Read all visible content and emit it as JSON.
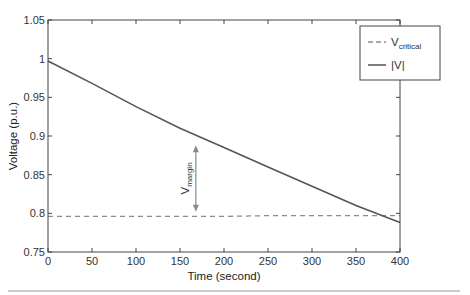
{
  "chart_data": {
    "type": "line",
    "title": "",
    "xlabel": "Time (second)",
    "ylabel": "Voltage (p.u.)",
    "xlim": [
      0,
      400
    ],
    "ylim": [
      0.75,
      1.05
    ],
    "grid": false,
    "legend_position": "upper right",
    "x_ticks": [
      "0",
      "50",
      "100",
      "150",
      "200",
      "250",
      "300",
      "350",
      "400"
    ],
    "y_ticks": [
      "0.75",
      "0.8",
      "0.85",
      "0.9",
      "0.95",
      "1",
      "1.05"
    ],
    "x": [
      0,
      50,
      100,
      150,
      200,
      250,
      300,
      350,
      400
    ],
    "series": [
      {
        "name": "V_critical",
        "style": "dashed",
        "color": "#8a8a8a",
        "values": [
          0.796,
          0.796,
          0.796,
          0.796,
          0.796,
          0.797,
          0.797,
          0.797,
          0.797
        ]
      },
      {
        "name": "|V|",
        "style": "solid",
        "color": "#555555",
        "values": [
          0.997,
          0.968,
          0.938,
          0.91,
          0.885,
          0.86,
          0.835,
          0.81,
          0.788
        ]
      }
    ],
    "legend": [
      {
        "label": "V",
        "subscript": "critical",
        "style": "dashed"
      },
      {
        "label": "|V|",
        "subscript": "",
        "style": "solid"
      }
    ],
    "annotations": [
      {
        "text": "V",
        "subscript": "margin",
        "type": "double-arrow",
        "x": 168,
        "y_from": 0.888,
        "y_to": 0.802
      }
    ]
  }
}
